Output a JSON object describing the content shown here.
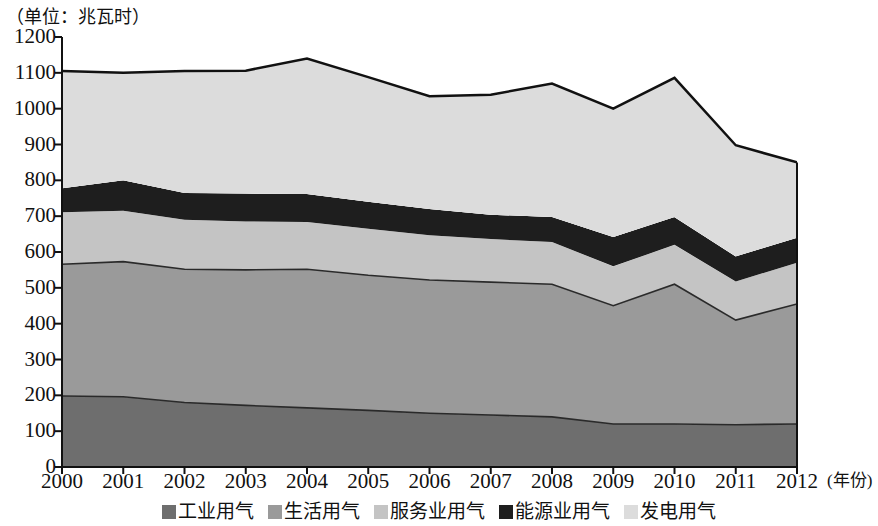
{
  "unit_caption": "（单位：兆瓦时）",
  "axis": {
    "x_title": "(年份)",
    "y_ticks": [
      "0",
      "100",
      "200",
      "300",
      "400",
      "500",
      "600",
      "700",
      "800",
      "900",
      "1000",
      "1100",
      "1200"
    ],
    "x_ticks": [
      "2000",
      "2001",
      "2002",
      "2003",
      "2004",
      "2005",
      "2006",
      "2007",
      "2008",
      "2009",
      "2010",
      "2011",
      "2012"
    ]
  },
  "legend": {
    "items": [
      {
        "label": "工业用气",
        "color": "#6e6e6e"
      },
      {
        "label": "生活用气",
        "color": "#9a9a9a"
      },
      {
        "label": "服务业用气",
        "color": "#c4c4c4"
      },
      {
        "label": "能源业用气",
        "color": "#1e1e1e"
      },
      {
        "label": "发电用气",
        "color": "#dcdcdc"
      }
    ]
  },
  "chart_data": {
    "type": "area",
    "stacked": true,
    "title": "",
    "subtitle": "",
    "xlabel": "年份",
    "ylabel": "兆瓦时",
    "unit": "兆瓦时",
    "grid": false,
    "legend_position": "bottom",
    "xlim": [
      2000,
      2012
    ],
    "ylim": [
      0,
      1200
    ],
    "ytick_step": 100,
    "categories": [
      2000,
      2001,
      2002,
      2003,
      2004,
      2005,
      2006,
      2007,
      2008,
      2009,
      2010,
      2011,
      2012
    ],
    "series": [
      {
        "name": "工业用气",
        "color": "#6e6e6e",
        "values": [
          198,
          196,
          180,
          172,
          165,
          158,
          150,
          145,
          140,
          120,
          120,
          118,
          120
        ]
      },
      {
        "name": "生活用气",
        "color": "#9a9a9a",
        "values": [
          368,
          377,
          372,
          378,
          387,
          377,
          372,
          371,
          370,
          330,
          390,
          292,
          335
        ]
      },
      {
        "name": "服务业用气",
        "color": "#c4c4c4",
        "values": [
          145,
          142,
          138,
          135,
          132,
          130,
          125,
          120,
          118,
          110,
          110,
          108,
          115
        ]
      },
      {
        "name": "能源业用气",
        "color": "#1e1e1e",
        "values": [
          67,
          85,
          75,
          78,
          78,
          75,
          73,
          68,
          70,
          82,
          78,
          70,
          70
        ]
      },
      {
        "name": "发电用气",
        "color": "#dcdcdc",
        "values": [
          327,
          300,
          340,
          343,
          378,
          348,
          315,
          335,
          372,
          358,
          388,
          310,
          210
        ]
      }
    ],
    "totals": [
      1105,
      1100,
      1105,
      1106,
      1140,
      1088,
      1035,
      1039,
      1070,
      1000,
      1086,
      898,
      850
    ]
  }
}
